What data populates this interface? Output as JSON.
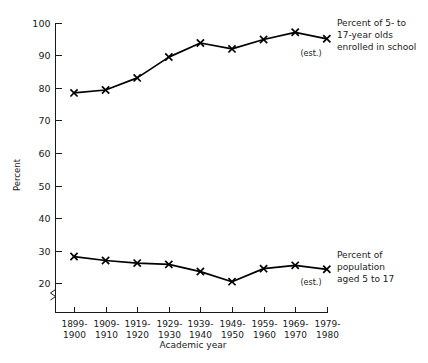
{
  "chart_data": {
    "type": "line",
    "title": "",
    "xlabel": "Academic year",
    "ylabel": "Percent",
    "ylim": [
      15,
      100
    ],
    "ytick_labels": [
      "20",
      "30",
      "40",
      "50",
      "60",
      "70",
      "80",
      "90",
      "100"
    ],
    "ytick_values": [
      20,
      30,
      40,
      50,
      60,
      70,
      80,
      90,
      100
    ],
    "axis_break": true,
    "grid": false,
    "legend_position": "right-inline-annotations",
    "categories": [
      "1899-\n1900",
      "1909-\n1910",
      "1919-\n1920",
      "1929-\n1930",
      "1939-\n1940",
      "1949-\n1950",
      "1959-\n1960",
      "1969-\n1970",
      "1979-\n1980"
    ],
    "categories_line1": [
      "1899-",
      "1909-",
      "1919-",
      "1929-",
      "1939-",
      "1949-",
      "1959-",
      "1969-",
      "1979-"
    ],
    "categories_line2": [
      "1900",
      "1910",
      "1920",
      "1930",
      "1940",
      "1950",
      "1960",
      "1970",
      "1980"
    ],
    "series": [
      {
        "name": "Percent of 5- to 17-year olds enrolled in school",
        "values": [
          78.4,
          79.3,
          83.0,
          89.4,
          93.7,
          91.9,
          94.8,
          97.0,
          95.0
        ],
        "annotation_lines": [
          "Percent of 5- to",
          "17-year olds",
          "enrolled in school"
        ],
        "estimated_last_point": true
      },
      {
        "name": "Percent of population aged 5 to 17",
        "values": [
          28.2,
          27.0,
          26.2,
          25.8,
          23.6,
          20.5,
          24.5,
          25.5,
          24.3
        ],
        "annotation_lines": [
          "Percent of",
          "population",
          "aged 5 to 17"
        ],
        "estimated_last_point": true
      }
    ],
    "estimate_marker_label": "(est.)"
  },
  "colors": {
    "line": "#000000",
    "axis": "#1a1a1a",
    "background": "#ffffff"
  }
}
